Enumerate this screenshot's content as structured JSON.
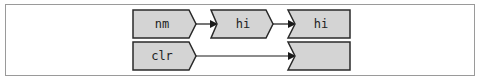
{
  "diagram": {
    "rows": [
      {
        "cells": [
          {
            "label": "nm"
          },
          {
            "label": "hi"
          },
          {
            "label": "hi"
          }
        ]
      },
      {
        "cells": [
          {
            "label": "clr"
          },
          {
            "label": ""
          }
        ]
      }
    ],
    "colors": {
      "box_fill": "#d4d4d4",
      "box_stroke": "#2a2a2a",
      "frame_stroke": "#9a9a9a",
      "arrow": "#1a1a1a"
    }
  }
}
